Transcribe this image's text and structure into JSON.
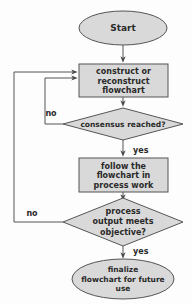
{
  "diagram": {
    "type": "flowchart",
    "colors": {
      "shape_fill": "#d9d9d9",
      "shape_stroke": "#555555",
      "text": "#2a2a2a",
      "arrow": "#4a4a4a",
      "background": "#fdfdfd"
    },
    "nodes": [
      {
        "id": "start",
        "shape": "ellipse",
        "lines": [
          "Start"
        ],
        "cx": 123,
        "cy": 28,
        "rx": 44,
        "ry": 17,
        "font_size": 9
      },
      {
        "id": "construct",
        "shape": "box",
        "lines": [
          "construct or",
          "reconstruct",
          "flowchart"
        ],
        "x": 79,
        "y": 64,
        "width": 89,
        "height": 33,
        "font_size": 8
      },
      {
        "id": "consensus",
        "shape": "diamond",
        "lines": [
          "consensus reached?"
        ],
        "cx": 123,
        "cy": 124,
        "rx": 60,
        "ry": 16,
        "font_size": 7.5
      },
      {
        "id": "follow",
        "shape": "box",
        "lines": [
          "follow the",
          "flowchart in",
          "process work"
        ],
        "x": 79,
        "y": 158,
        "width": 89,
        "height": 34,
        "font_size": 8
      },
      {
        "id": "objective",
        "shape": "diamond",
        "lines": [
          "process",
          "output  meets",
          "objective?"
        ],
        "cx": 123,
        "cy": 222,
        "rx": 60,
        "ry": 24,
        "font_size": 8
      },
      {
        "id": "finalize",
        "shape": "ellipse",
        "lines": [
          "finalize",
          "flowchart for future",
          "use"
        ],
        "cx": 123,
        "cy": 279,
        "rx": 51,
        "ry": 20,
        "font_size": 7.5
      }
    ],
    "edges": [
      {
        "id": "start-to-construct",
        "from": "start",
        "to": "construct",
        "label": ""
      },
      {
        "id": "construct-to-consensus",
        "from": "construct",
        "to": "consensus",
        "label": ""
      },
      {
        "id": "consensus-no-loop",
        "from": "consensus",
        "to": "construct",
        "label": "no",
        "label_x": 51,
        "label_y": 113
      },
      {
        "id": "consensus-yes",
        "from": "consensus",
        "to": "follow",
        "label": "yes",
        "label_x": 133,
        "label_y": 150
      },
      {
        "id": "follow-to-objective",
        "from": "follow",
        "to": "objective",
        "label": ""
      },
      {
        "id": "objective-no-loop",
        "from": "objective",
        "to": "construct",
        "label": "no",
        "label_x": 32,
        "label_y": 213
      },
      {
        "id": "objective-yes",
        "from": "objective",
        "to": "finalize",
        "label": "yes",
        "label_x": 133,
        "label_y": 251
      }
    ],
    "edge_label_font_size": 8
  }
}
